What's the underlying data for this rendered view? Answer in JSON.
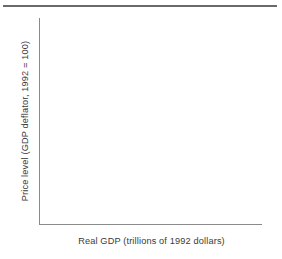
{
  "figure": {
    "top_rule": "horizontal-rule",
    "background_color": "#ffffff",
    "axis_color": "#8a8a8a",
    "rule_color": "#6a6a6a",
    "text_color": "#3a3a3a"
  },
  "chart_data": {
    "type": "line",
    "title": "",
    "subtitle": "",
    "xlabel": "Real GDP (trillions of 1992 dollars)",
    "ylabel": "Price level (GDP deflator, 1992 = 100)",
    "series": [],
    "x": [],
    "categories": [],
    "values": [],
    "xticks": [],
    "yticks": [],
    "xticklabels": [],
    "yticklabels": [],
    "grid": false,
    "legend": false,
    "legend_position": "none",
    "annotations": [],
    "note": "Blank axes template — no data plotted; only the two axis spines and their titles are drawn."
  }
}
